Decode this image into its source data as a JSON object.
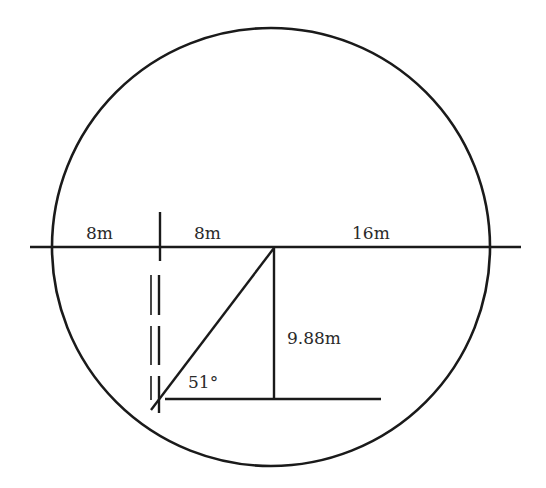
{
  "diagram": {
    "type": "geometry-figure",
    "colors": {
      "stroke": "#1a1a1a",
      "text": "#2a2a2a",
      "background": "#ffffff"
    },
    "circle": {
      "cx": 271,
      "cy": 247,
      "r": 219
    },
    "labels": {
      "left_segment": "8m",
      "middle_segment": "8m",
      "right_segment": "16m",
      "height": "9.88m",
      "angle": "51°"
    }
  }
}
